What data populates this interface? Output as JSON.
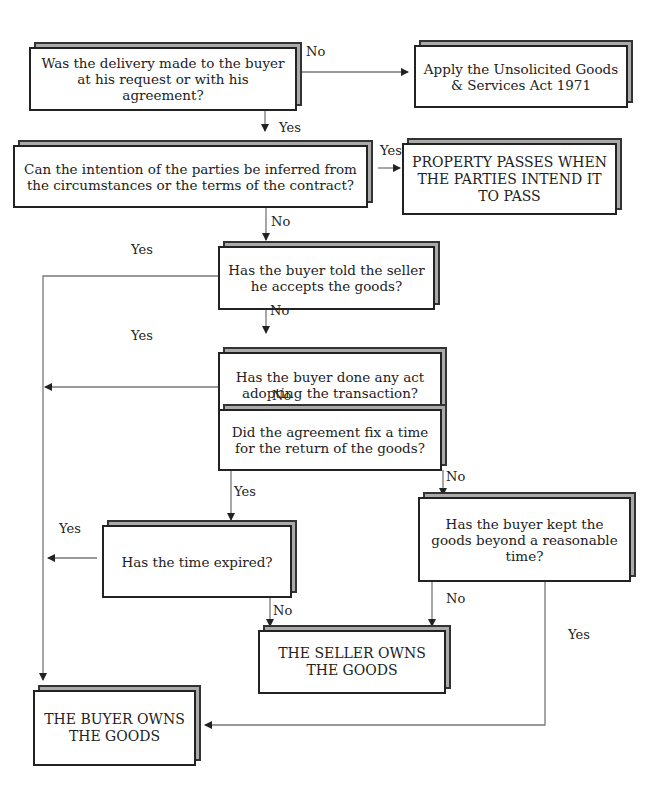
{
  "nodes": {
    "q1": "Was the delivery made to the buyer at his request or with his agreement?",
    "act": "Apply the Unsolicited Goods & Services Act 1971",
    "q2": "Can the intention of the parties be inferred from the circumstances or the terms of the contract?",
    "intent": "PROPERTY PASSES WHEN THE PARTIES INTEND IT TO PASS",
    "q3": "Has the buyer told the seller he accepts the goods?",
    "q4": "Has the buyer done any act adopting the transaction?",
    "q5": "Did the agreement fix a time for the return of the goods?",
    "q6": "Has the time expired?",
    "q7": "Has the buyer kept the goods beyond a reasonable time?",
    "seller": "THE SELLER OWNS THE GOODS",
    "buyer": "THE BUYER OWNS THE GOODS"
  },
  "labels": {
    "q1_no": "No",
    "q1_yes": "Yes",
    "q2_yes": "Yes",
    "q2_no": "No",
    "q3_yes": "Yes",
    "q3_no": "No",
    "q4_yes": "Yes",
    "q4_no": "No",
    "q5_yes": "Yes",
    "q5_no": "No",
    "q6_yes": "Yes",
    "q6_no": "No",
    "q7_no": "No",
    "q7_yes": "Yes"
  }
}
